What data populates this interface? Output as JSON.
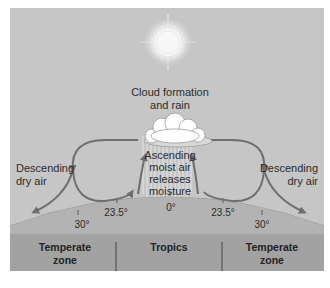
{
  "diagram": {
    "title_label": {
      "line1": "Cloud formation",
      "line2": "and rain"
    },
    "center_label": {
      "line1": "Ascending",
      "line2": "moist air",
      "line3": "releases",
      "line4": "moisture"
    },
    "left_label": {
      "line1": "Descending",
      "line2": "dry air"
    },
    "right_label": {
      "line1": "Descending",
      "line2": "dry air"
    },
    "latitudes": {
      "left_30": "30°",
      "left_23": "23.5°",
      "equator": "0°",
      "right_23": "23.5°",
      "right_30": "30°"
    },
    "zones": {
      "left": {
        "line1": "Temperate",
        "line2": "zone"
      },
      "center": {
        "line1": "Tropics"
      },
      "right": {
        "line1": "Temperate",
        "line2": "zone"
      }
    },
    "colors": {
      "sky": "#c6c6c6",
      "earth": "#a9a9a9",
      "zone_band": "#a2a2a2",
      "arrow": "#6e6e6e",
      "cloud": "#ffffff",
      "sun": "#f4f4f4"
    }
  }
}
